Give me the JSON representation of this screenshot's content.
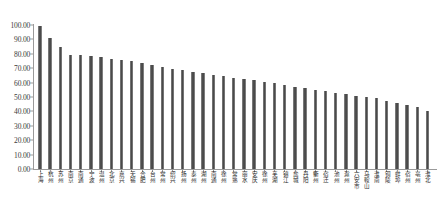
{
  "chart_data": {
    "type": "bar",
    "title": "",
    "subtitle": "",
    "xlabel": "",
    "ylabel": "",
    "ylim": [
      0,
      100
    ],
    "ytick_labels": [
      "100.00",
      "90.00",
      "80.00",
      "70.00",
      "60.00",
      "50.00",
      "40.00",
      "30.00",
      "20.00",
      "10.00",
      "0.00"
    ],
    "ytick_values": [
      100,
      90,
      80,
      70,
      60,
      50,
      40,
      30,
      20,
      10,
      0
    ],
    "ytick_step": 10,
    "grid": false,
    "legend": null,
    "legend_position": "none",
    "bar_color": "#595959",
    "axis_color": "#9a9a9a",
    "categories": [
      "上海",
      "杭州",
      "苏州",
      "南京",
      "南通",
      "宁波",
      "温州",
      "北京",
      "嘉兴",
      "无锡",
      "合肥",
      "台州",
      "常州",
      "绍兴",
      "扬州",
      "泰州",
      "湖州",
      "南通",
      "徐州",
      "常熟",
      "丽水",
      "安庆",
      "徐州",
      "芜湖",
      "镇江",
      "盐城",
      "丹阳",
      "衢州",
      "宿迁",
      "池州",
      "滁州",
      "六安市",
      "马鞍山",
      "淮南",
      "铜陵",
      "蚌埠",
      "宿州",
      "亳州",
      "淮北"
    ],
    "values": [
      99.0,
      91.0,
      84.5,
      79.5,
      79.0,
      78.5,
      77.5,
      76.5,
      76.0,
      75.0,
      73.5,
      72.0,
      70.5,
      69.5,
      68.5,
      67.5,
      66.5,
      65.5,
      64.5,
      63.5,
      62.5,
      61.5,
      60.5,
      59.5,
      58.5,
      57.0,
      56.0,
      55.0,
      54.0,
      53.0,
      52.0,
      51.0,
      50.0,
      49.0,
      47.5,
      46.0,
      44.5,
      43.0,
      40.0
    ]
  }
}
